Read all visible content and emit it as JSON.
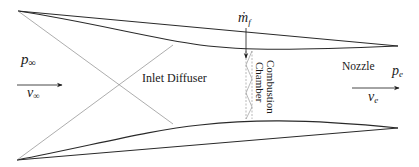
{
  "diagram": {
    "labels": {
      "freestream_pressure": "p",
      "freestream_pressure_sub": "∞",
      "freestream_velocity": "v",
      "freestream_velocity_sub": "∞",
      "fuel_flow": "ṁ",
      "fuel_flow_sub": "f",
      "inlet": "Inlet Diffuser",
      "combustion_line1": "Combustion",
      "combustion_line2": "Chamber",
      "nozzle": "Nozzle",
      "exit_pressure": "p",
      "exit_pressure_sub": "e",
      "exit_velocity": "v",
      "exit_velocity_sub": "e"
    },
    "colors": {
      "wall": "#2a2a2a",
      "shock": "#8a8a8a",
      "text": "#1a1a1a"
    }
  }
}
